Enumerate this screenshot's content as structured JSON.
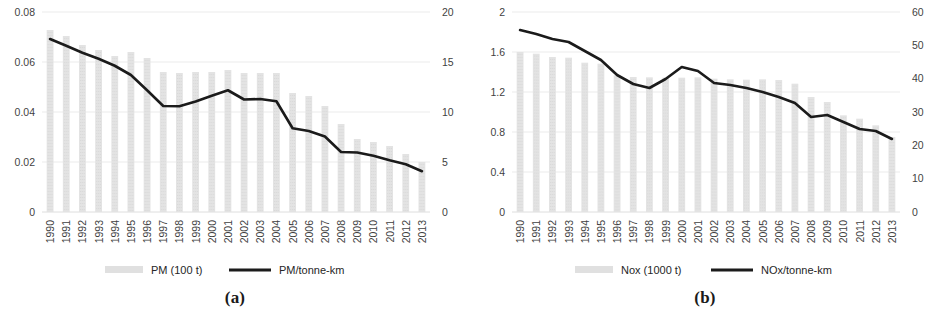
{
  "figure": {
    "panels": [
      {
        "caption": "(a)",
        "left_axis": {
          "ticks": [
            "0",
            "0.02",
            "0.04",
            "0.06",
            "0.08"
          ],
          "min": 0,
          "max": 0.08
        },
        "right_axis": {
          "ticks": [
            "0",
            "5",
            "10",
            "15",
            "20"
          ],
          "min": 0,
          "max": 20
        },
        "legend": [
          {
            "label": "PM (100 t)",
            "marker": "bar-swatch",
            "color": "#e0e0e0"
          },
          {
            "label": "PM/tonne-km",
            "marker": "line-swatch",
            "color": "#1b1b1b"
          }
        ]
      },
      {
        "caption": "(b)",
        "left_axis": {
          "ticks": [
            "0",
            "0.4",
            "0.8",
            "1.2",
            "1.6",
            "2"
          ],
          "min": 0,
          "max": 2
        },
        "right_axis": {
          "ticks": [
            "0",
            "10",
            "20",
            "30",
            "40",
            "50",
            "60"
          ],
          "min": 0,
          "max": 60
        },
        "legend": [
          {
            "label": "Nox (1000 t)",
            "marker": "bar-swatch",
            "color": "#e0e0e0"
          },
          {
            "label": "NOx/tonne-km",
            "marker": "line-swatch",
            "color": "#1b1b1b"
          }
        ]
      }
    ]
  },
  "chart_data": [
    {
      "type": "bar",
      "title": "",
      "panel": "(a)",
      "xlabel": "",
      "ylabel": "",
      "categories": [
        "1990",
        "1991",
        "1992",
        "1993",
        "1994",
        "1995",
        "1996",
        "1997",
        "1998",
        "1999",
        "2000",
        "2001",
        "2002",
        "2003",
        "2004",
        "2005",
        "2006",
        "2007",
        "2008",
        "2009",
        "2010",
        "2011",
        "2012",
        "2013"
      ],
      "grid": true,
      "legend_position": "bottom",
      "series": [
        {
          "name": "PM (100 t)",
          "type": "bar",
          "axis": "right",
          "unit": "100 t",
          "ylim": [
            0,
            20
          ],
          "values": [
            18.2,
            17.6,
            16.7,
            16.2,
            15.6,
            16.0,
            15.4,
            14.0,
            13.9,
            14.0,
            14.0,
            14.2,
            13.9,
            13.9,
            13.9,
            11.9,
            11.6,
            10.6,
            8.8,
            7.3,
            7.0,
            6.6,
            5.8,
            5.0
          ]
        },
        {
          "name": "PM/tonne-km",
          "type": "line",
          "axis": "left",
          "unit": "PM per tonne-km",
          "ylim": [
            0,
            0.08
          ],
          "values": [
            0.0692,
            0.0665,
            0.0637,
            0.0613,
            0.0585,
            0.0548,
            0.0487,
            0.0424,
            0.0423,
            0.0442,
            0.0465,
            0.0487,
            0.045,
            0.0452,
            0.0443,
            0.0335,
            0.0324,
            0.0302,
            0.024,
            0.0238,
            0.0225,
            0.0207,
            0.0191,
            0.0163
          ]
        }
      ]
    },
    {
      "type": "bar",
      "title": "",
      "panel": "(b)",
      "xlabel": "",
      "ylabel": "",
      "categories": [
        "1990",
        "1991",
        "1992",
        "1993",
        "1994",
        "1995",
        "1996",
        "1997",
        "1998",
        "1999",
        "2000",
        "2001",
        "2002",
        "2003",
        "2004",
        "2005",
        "2006",
        "2007",
        "2008",
        "2009",
        "2010",
        "2011",
        "2012",
        "2013"
      ],
      "grid": true,
      "legend_position": "bottom",
      "series": [
        {
          "name": "Nox (1000 t)",
          "type": "bar",
          "axis": "right",
          "unit": "1000 t",
          "ylim": [
            0,
            60
          ],
          "values": [
            48.0,
            47.5,
            46.5,
            46.3,
            44.8,
            44.5,
            41.0,
            40.5,
            40.4,
            40.3,
            40.3,
            40.4,
            40.0,
            39.8,
            39.7,
            39.8,
            39.6,
            38.5,
            34.5,
            33.0,
            29.0,
            28.0,
            26.0,
            22.5
          ]
        },
        {
          "name": "NOx/tonne-km",
          "type": "line",
          "axis": "left",
          "unit": "NOx per tonne-km",
          "ylim": [
            0,
            2
          ],
          "values": [
            1.82,
            1.78,
            1.73,
            1.7,
            1.61,
            1.52,
            1.37,
            1.28,
            1.24,
            1.33,
            1.45,
            1.41,
            1.29,
            1.27,
            1.24,
            1.2,
            1.15,
            1.09,
            0.95,
            0.97,
            0.9,
            0.83,
            0.81,
            0.73
          ]
        }
      ]
    }
  ]
}
